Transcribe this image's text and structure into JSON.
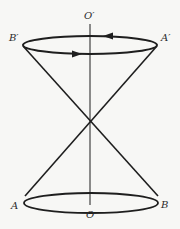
{
  "diagram": {
    "title": "",
    "type": "double cone with circular loops",
    "colors": {
      "line": "#1e1e1e",
      "background": "#f7f7f5",
      "label": "#2a2a2a"
    },
    "labels": {
      "top_axis": "O′",
      "bottom_axis": "O",
      "top_left": "B′",
      "top_right": "A′",
      "bottom_left": "A",
      "bottom_right": "B"
    },
    "arrows": [
      {
        "on": "top-ellipse-back-edge",
        "direction": "left"
      },
      {
        "on": "top-ellipse-front-edge",
        "direction": "right"
      }
    ]
  }
}
